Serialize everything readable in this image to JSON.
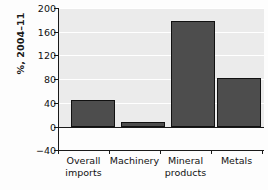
{
  "chart_data": {
    "type": "bar",
    "title": "",
    "subtitle": "",
    "xlabel": "",
    "ylabel": "%, 2004–11",
    "categories": [
      "Overall imports",
      "Machinery",
      "Mineral products",
      "Metals"
    ],
    "category_lines": [
      [
        "Overall",
        "imports"
      ],
      [
        "Machinery",
        ""
      ],
      [
        "Mineral",
        "products"
      ],
      [
        "Metals",
        ""
      ]
    ],
    "values": [
      46,
      8,
      178,
      83
    ],
    "ylim": [
      -40,
      200
    ],
    "yticks": [
      200,
      160,
      120,
      80,
      40,
      0,
      -40
    ],
    "ytick_labels": [
      "200",
      "160",
      "120",
      "80",
      "40",
      "0",
      "−40"
    ],
    "grid": true,
    "grid_axis": "y",
    "legend": null,
    "colors": {
      "bar_fill": "#4d4d4d",
      "bar_edge": "#111111",
      "plot_background": "#ebebeb",
      "gridline": "#ffffff",
      "axis": "#1a1a1a",
      "text": "#111111",
      "page_background": "#fdfdfd"
    }
  }
}
